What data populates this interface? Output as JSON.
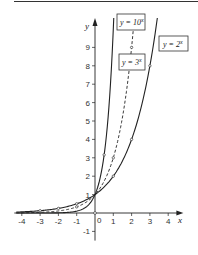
{
  "chart_data": {
    "type": "line",
    "title": "",
    "xlabel": "x",
    "ylabel": "y",
    "xlim": [
      -4.3,
      4.5
    ],
    "ylim": [
      -1.5,
      10.6
    ],
    "x_ticks": [
      -4,
      -3,
      -2,
      -1,
      0,
      1,
      2,
      3,
      4
    ],
    "x_tick_labels": [
      "-4",
      "-3",
      "-2",
      "-1",
      "0",
      "1",
      "2",
      "3",
      "4"
    ],
    "y_ticks": [
      -1,
      1,
      2,
      3,
      4,
      5,
      6,
      7,
      8,
      9
    ],
    "y_tick_labels": [
      "-1",
      "1",
      "2",
      "3",
      "4",
      "5",
      "6",
      "7",
      "8",
      "9"
    ],
    "grid": false,
    "legend": "inline boxed labels",
    "series": [
      {
        "name": "y = 10^x",
        "label": "y = 10",
        "exponent": "x",
        "style": "solid",
        "x": [
          -4,
          -3,
          -2,
          -1,
          0,
          0.5,
          1
        ],
        "values": [
          0.0001,
          0.001,
          0.01,
          0.1,
          1,
          3.16,
          10
        ],
        "marked_points": [
          [
            0.5,
            3.16
          ]
        ]
      },
      {
        "name": "y = 3^x",
        "label": "y = 3",
        "exponent": "x",
        "style": "dashed",
        "x": [
          -4,
          -3,
          -2,
          -1,
          0,
          1,
          2
        ],
        "values": [
          0.012,
          0.037,
          0.111,
          0.333,
          1,
          3,
          9
        ],
        "marked_points": [
          [
            -1,
            0.333
          ],
          [
            1,
            3
          ],
          [
            2,
            9
          ]
        ]
      },
      {
        "name": "y = 2^x",
        "label": "y = 2",
        "exponent": "x",
        "style": "solid",
        "x": [
          -4,
          -3,
          -2,
          -1,
          0,
          1,
          2,
          3
        ],
        "values": [
          0.0625,
          0.125,
          0.25,
          0.5,
          1,
          2,
          4,
          8
        ],
        "marked_points": [
          [
            -3,
            0.125
          ],
          [
            -2,
            0.25
          ],
          [
            -1,
            0.5
          ],
          [
            1,
            2
          ],
          [
            2,
            4
          ],
          [
            3,
            8
          ]
        ]
      }
    ],
    "annotations": [
      "y = 10^x",
      "y = 3^x",
      "y = 2^x"
    ],
    "origin_label": "0"
  },
  "labels": {
    "x_axis": "x",
    "y_axis": "y",
    "origin": "0",
    "series_10": {
      "base": "y = 10",
      "exp": "x"
    },
    "series_3": {
      "base": "y = 3",
      "exp": "x"
    },
    "series_2": {
      "base": "y = 2",
      "exp": "x"
    }
  },
  "colors": {
    "ink": "#222222",
    "background": "#ffffff"
  }
}
